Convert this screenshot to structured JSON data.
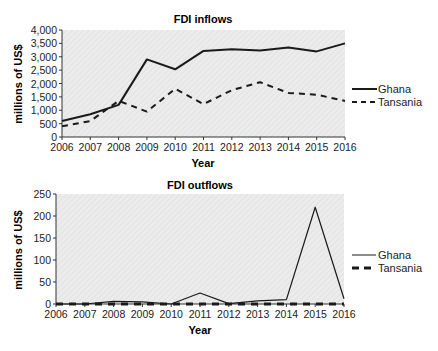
{
  "chart_data": [
    {
      "type": "line",
      "title": "FDI inflows",
      "xlabel": "Year",
      "ylabel": "millions of US$",
      "x": [
        2006,
        2007,
        2008,
        2009,
        2010,
        2011,
        2012,
        2013,
        2014,
        2015,
        2016
      ],
      "x_tick_labels": [
        "2006",
        "2007",
        "2008",
        "2009",
        "2010",
        "2011",
        "2012",
        "2013",
        "2014",
        "2015",
        "2016"
      ],
      "y_tick_labels": [
        "0",
        "500",
        "1,000",
        "1,500",
        "2,000",
        "2,500",
        "3,000",
        "3,500",
        "4,000"
      ],
      "ylim": [
        0,
        4000
      ],
      "grid": false,
      "legend_position": "right",
      "series": [
        {
          "name": "Ghana",
          "style": "solid",
          "values": [
            600,
            850,
            1200,
            2900,
            2530,
            3220,
            3280,
            3230,
            3350,
            3200,
            3500
          ]
        },
        {
          "name": "Tansania",
          "style": "dashed",
          "values": [
            400,
            600,
            1350,
            950,
            1800,
            1230,
            1750,
            2050,
            1650,
            1580,
            1350
          ]
        }
      ]
    },
    {
      "type": "line",
      "title": "FDI outflows",
      "xlabel": "Year",
      "ylabel": "millions of US$",
      "x": [
        2006,
        2007,
        2008,
        2009,
        2010,
        2011,
        2012,
        2013,
        2014,
        2015,
        2016
      ],
      "x_tick_labels": [
        "2006",
        "2007",
        "2008",
        "2009",
        "2010",
        "2011",
        "2012",
        "2013",
        "2014",
        "2015",
        "2016"
      ],
      "y_tick_labels": [
        "0",
        "50",
        "100",
        "150",
        "200",
        "250"
      ],
      "ylim": [
        0,
        250
      ],
      "grid": false,
      "legend_position": "right",
      "series": [
        {
          "name": "Ghana",
          "style": "thin-solid",
          "values": [
            0,
            0,
            6,
            5,
            0,
            25,
            1,
            7,
            10,
            220,
            12
          ]
        },
        {
          "name": "Tansania",
          "style": "thick-dashed",
          "values": [
            0,
            0,
            0,
            0,
            0,
            0,
            0,
            0,
            0,
            0,
            0
          ]
        }
      ]
    }
  ],
  "top_chart": {
    "title": "FDI inflows",
    "xlabel": "Year",
    "ylabel": "millions of US$",
    "legend": [
      "Ghana",
      "Tansania"
    ]
  },
  "bottom_chart": {
    "title": "FDI outflows",
    "xlabel": "Year",
    "ylabel": "millions of US$",
    "legend": [
      "Ghana",
      "Tansania"
    ]
  },
  "colors": {
    "plot_bg": "#e9e9e9",
    "line": "#1a1a1a"
  }
}
